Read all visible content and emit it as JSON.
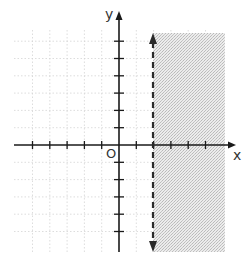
{
  "chart_data": {
    "type": "inequality-graph",
    "title": "",
    "xlabel": "x",
    "ylabel": "y",
    "origin_label": "O",
    "xlim": [
      -6,
      6
    ],
    "ylim": [
      -6,
      7
    ],
    "grid": true,
    "x_ticks": [
      -5,
      -4,
      -3,
      -2,
      -1,
      1,
      2,
      3,
      4,
      5
    ],
    "y_ticks": [
      -5,
      -4,
      -3,
      -2,
      -1,
      1,
      2,
      3,
      4,
      5,
      6
    ],
    "tick_labels_shown": false,
    "boundary": {
      "equation": "x = 2",
      "style": "dashed",
      "arrows": "both"
    },
    "inequality": "x > 2",
    "shaded_region": "right of x = 2",
    "colors": {
      "axis": "#1a1a1a",
      "boundary": "#2a2a2a",
      "shade": "#d6d6d6",
      "grid": "#cfcfcf"
    }
  }
}
